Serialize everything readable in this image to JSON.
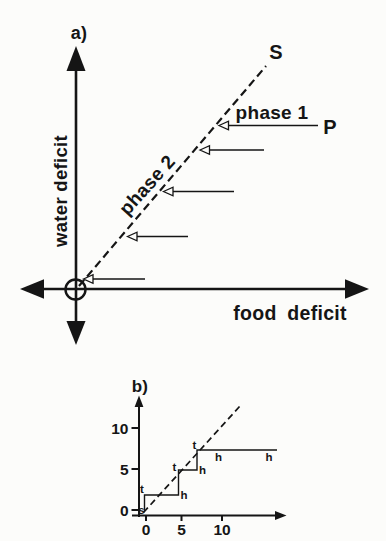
{
  "colors": {
    "ink": "#151515",
    "paper": "#fcfcfa"
  },
  "panel_a": {
    "panel_label": "a)",
    "y_axis_label": "water deficit",
    "x_axis_label": "food deficit",
    "switching_line_label": "S",
    "point_label": "P",
    "phase_1_label": "phase 1",
    "phase_2_label": "phase 2",
    "geom": {
      "y_axis": {
        "x": 76,
        "top_tip": 46,
        "bottom_tip": 345
      },
      "x_axis": {
        "y": 289,
        "left_tip": 20,
        "right_tip": 369
      },
      "origin_circle": {
        "cx": 75.5,
        "cy": 289.5,
        "r": 10
      },
      "dashed_line": {
        "x1": 79,
        "y1": 286,
        "x2": 266,
        "y2": 66
      },
      "trajectory_arrows": [
        {
          "y": 125.5,
          "tip_x": 219,
          "tail_x": 318
        },
        {
          "y": 150,
          "tip_x": 200,
          "tail_x": 264
        },
        {
          "y": 191.5,
          "tip_x": 163.5,
          "tail_x": 234
        },
        {
          "y": 236.5,
          "tip_x": 127.5,
          "tail_x": 188
        },
        {
          "y": 279,
          "tip_x": 83.5,
          "tail_x": 145
        }
      ]
    }
  },
  "panel_b": {
    "panel_label": "b)",
    "y_ticks": [
      {
        "label": "10",
        "y": 428
      },
      {
        "label": "5",
        "y": 469
      },
      {
        "label": "0",
        "y": 510
      }
    ],
    "x_ticks": [
      {
        "label": "0",
        "x": 146
      },
      {
        "label": "5",
        "x": 181.5
      },
      {
        "label": "10",
        "x": 222
      }
    ],
    "step_markers": [
      {
        "label": "s",
        "x": 141.5,
        "y": 509.5
      },
      {
        "label": "t",
        "x": 142,
        "y": 489
      },
      {
        "label": "h",
        "x": 184,
        "y": 495
      },
      {
        "label": "t",
        "x": 174.5,
        "y": 466.5
      },
      {
        "label": "h",
        "x": 202.5,
        "y": 470
      },
      {
        "label": "t",
        "x": 194.5,
        "y": 444.5
      },
      {
        "label": "h",
        "x": 218.5,
        "y": 457
      },
      {
        "label": "h",
        "x": 269,
        "y": 457
      }
    ],
    "geom": {
      "y_axis": {
        "x": 139,
        "top_tip": 395.5,
        "bottom": 517
      },
      "x_axis": {
        "y": 515.5,
        "left": 132,
        "right_tip": 286.5
      },
      "dashed_line": {
        "x1": 143.5,
        "y1": 512.5,
        "x2": 240,
        "y2": 406
      },
      "step_path_px": [
        [
          144.5,
          511
        ],
        [
          144.5,
          495
        ],
        [
          178.5,
          495
        ],
        [
          178.5,
          470
        ],
        [
          197,
          470
        ],
        [
          197,
          450
        ],
        [
          277,
          450
        ]
      ]
    }
  },
  "chart_data": [
    {
      "type": "line",
      "panel": "a)",
      "xlabel": "food deficit",
      "ylabel": "water deficit",
      "description": "Schematic state space: dashed switching line S through circled origin, slope ~1.15; region right of line labelled phase 1, line labelled phase 2; point P at right; 5 horizontal open-headed arrows point left onto line S at decreasing heights.",
      "series": [
        {
          "name": "S",
          "style": "dashed",
          "points_px": [
            [
              79,
              286
            ],
            [
              266,
              66
            ]
          ]
        }
      ],
      "annotations": [
        "S",
        "P",
        "phase 1",
        "phase 2"
      ]
    },
    {
      "type": "line",
      "panel": "b)",
      "x_ticks": [
        0,
        5,
        10
      ],
      "y_ticks": [
        0,
        5,
        10
      ],
      "xlim": [
        -0.5,
        19.5
      ],
      "ylim": [
        -1,
        14.5
      ],
      "series": [
        {
          "name": "behaviour trajectory (staircase)",
          "style": "solid-step",
          "points": [
            [
              0,
              0
            ],
            [
              0,
              1.8
            ],
            [
              4.3,
              1.8
            ],
            [
              4.3,
              4.9
            ],
            [
              6.7,
              4.9
            ],
            [
              6.7,
              7.3
            ],
            [
              17.2,
              7.3
            ]
          ]
        },
        {
          "name": "switching line",
          "style": "dashed",
          "points": [
            [
              -0.3,
              -0.3
            ],
            [
              12.4,
              12.7
            ]
          ]
        }
      ],
      "point_labels": [
        {
          "label": "s",
          "x": -0.6,
          "y": 0.1
        },
        {
          "label": "t",
          "x": -0.5,
          "y": 2.5
        },
        {
          "label": "h",
          "x": 4.9,
          "y": 1.8
        },
        {
          "label": "t",
          "x": 3.8,
          "y": 5.2
        },
        {
          "label": "h",
          "x": 7.4,
          "y": 4.9
        },
        {
          "label": "t",
          "x": 6.4,
          "y": 7.9
        },
        {
          "label": "h",
          "x": 9.5,
          "y": 6.5
        },
        {
          "label": "h",
          "x": 16.2,
          "y": 6.5
        }
      ]
    }
  ]
}
